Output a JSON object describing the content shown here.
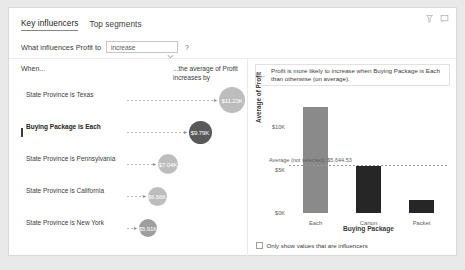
{
  "header": {
    "icons": [
      {
        "name": "filter-icon",
        "glyph": "filter"
      },
      {
        "name": "focus-mode-icon",
        "glyph": "focus"
      }
    ]
  },
  "tabs": [
    {
      "label": "Key influencers",
      "active": true
    },
    {
      "label": "Top segments",
      "active": false
    }
  ],
  "question": {
    "label": "What influences Profit to",
    "selected_value": "increase",
    "options": [
      "increase",
      "decrease"
    ],
    "help_label": "?"
  },
  "left_panel": {
    "heading_when": "When...",
    "heading_effect": "...the average of Profit increases by",
    "rows": [
      {
        "label": "State Province is Texas",
        "value": "$11.23K",
        "selected": false,
        "bubble_px": 26,
        "color": "#bdbdbd"
      },
      {
        "label": "Buying Package is Each",
        "value": "$9.79K",
        "selected": true,
        "bubble_px": 23,
        "color": "#595959"
      },
      {
        "label": "State Province is Pennsylvania",
        "value": "$7.04K",
        "selected": false,
        "bubble_px": 20,
        "color": "#bdbdbd"
      },
      {
        "label": "State Province is California",
        "value": "$6.66K",
        "selected": false,
        "bubble_px": 19,
        "color": "#bdbdbd"
      },
      {
        "label": "State Province is New York",
        "value": "$5.91K",
        "selected": false,
        "bubble_px": 18,
        "color": "#9e9e9e"
      }
    ]
  },
  "right_panel": {
    "back_glyph": "←",
    "explanation": "Profit is more likely to increase when Buying Package is Each than otherwise (on average).",
    "checkbox": {
      "label": "Only show values that are influencers",
      "checked": false
    }
  },
  "chart_data": {
    "type": "bar",
    "title": "",
    "categories": [
      "Each",
      "Carton",
      "Packet"
    ],
    "values": [
      12400,
      5500,
      1500
    ],
    "xlabel": "Buying Package",
    "ylabel": "Average of Profit",
    "ylim": [
      0,
      14000
    ],
    "yticks": [
      0,
      5000,
      10000
    ],
    "ytick_labels": [
      "$0K",
      "$5K",
      "$10K"
    ],
    "grid": false,
    "legend": "none",
    "bar_colors": [
      "#8a8a8a",
      "#262626",
      "#262626"
    ],
    "reference_line": {
      "label": "Average (not selected): $5,644.53",
      "value": 5644.53,
      "style": "dotted"
    }
  }
}
